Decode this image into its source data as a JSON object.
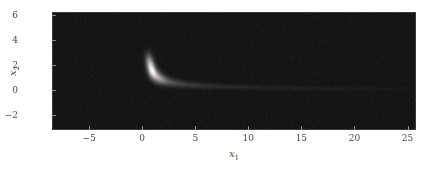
{
  "figure": {
    "name": "density-plot",
    "background_color": "#ffffff",
    "plot_background_color": "#161414",
    "frame_color": "#3b3836",
    "tick_color": "#8e8a88",
    "label_color": "#4a4745"
  },
  "chart_data": {
    "type": "heatmap",
    "title": "",
    "subtitle": "",
    "xlabel": "x",
    "xlabel_sub": "1",
    "ylabel": "x",
    "ylabel_sub": "2",
    "xlim": [
      -8.5,
      25.8
    ],
    "ylim": [
      -3.2,
      6.2
    ],
    "xticks": [
      -5,
      0,
      5,
      10,
      15,
      20,
      25
    ],
    "xtick_labels": [
      "−5",
      "0",
      "5",
      "10",
      "15",
      "20",
      "25"
    ],
    "yticks": [
      -2,
      0,
      2,
      4,
      6
    ],
    "ytick_labels": [
      "−2",
      "0",
      "2",
      "4",
      "6"
    ],
    "grid": false,
    "legend": "none",
    "colormap": "gray",
    "colormap_low": "#161414",
    "colormap_high": "#ffffff",
    "ridge": {
      "comment": "Approximate centerline (x1, x2) of the bright banana-shaped ridge",
      "points": [
        [
          0.55,
          2.6
        ],
        [
          0.7,
          2.1
        ],
        [
          0.85,
          1.7
        ],
        [
          1.0,
          1.4
        ],
        [
          1.3,
          1.1
        ],
        [
          1.7,
          0.88
        ],
        [
          2.2,
          0.7
        ],
        [
          3.0,
          0.54
        ],
        [
          4.0,
          0.42
        ],
        [
          5.5,
          0.32
        ],
        [
          7.5,
          0.25
        ],
        [
          10.0,
          0.19
        ],
        [
          13.0,
          0.15
        ],
        [
          16.0,
          0.12
        ],
        [
          20.0,
          0.09
        ],
        [
          25.0,
          0.07
        ]
      ]
    },
    "intensity": {
      "comment": "Relative intensity (0-1) along the ridge centerline, same ordering as ridge.points",
      "values": [
        0.42,
        0.72,
        0.92,
        1.0,
        0.93,
        0.8,
        0.66,
        0.5,
        0.38,
        0.27,
        0.19,
        0.13,
        0.09,
        0.07,
        0.05,
        0.03
      ]
    },
    "width": {
      "comment": "Approximate gaussian half-width in x2 units along the ridge",
      "values": [
        0.36,
        0.36,
        0.34,
        0.32,
        0.29,
        0.26,
        0.23,
        0.2,
        0.17,
        0.15,
        0.13,
        0.12,
        0.11,
        0.1,
        0.1,
        0.09
      ]
    }
  }
}
